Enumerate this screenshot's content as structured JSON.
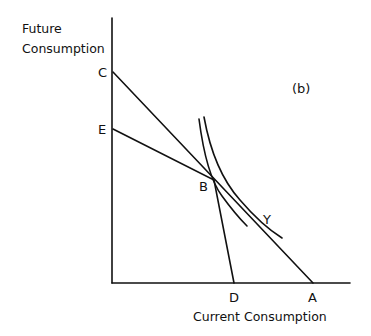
{
  "figure": {
    "panel_label": "(b)",
    "y_axis_title_line1": "Future",
    "y_axis_title_line2": "Consumption",
    "x_axis_title": "Current Consumption",
    "points": {
      "C": "C",
      "E": "E",
      "B": "B",
      "Y": "Y",
      "D": "D",
      "A": "A"
    },
    "lines": [
      {
        "name": "budget-line-CA",
        "from": "C",
        "to": "A"
      },
      {
        "name": "budget-line-ED",
        "from": "E",
        "to": "D",
        "through": "B"
      }
    ],
    "curves": [
      {
        "name": "indifference-curve-inner",
        "through": "B"
      },
      {
        "name": "indifference-curve-outer",
        "tangent_at": "Y"
      }
    ],
    "colors": {
      "ink": "#111111",
      "background": "#ffffff"
    }
  }
}
